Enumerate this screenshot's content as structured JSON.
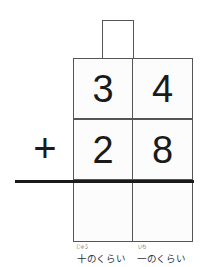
{
  "problem": {
    "operator": "+",
    "carry": "",
    "top_row": {
      "tens": "3",
      "ones": "4"
    },
    "second_row": {
      "tens": "2",
      "ones": "8"
    },
    "answer_row": {
      "tens": "",
      "ones": ""
    }
  },
  "labels": {
    "tens": "十のくらい",
    "tens_ruby": "じゅう",
    "ones": "一のくらい",
    "ones_ruby": "いち"
  }
}
